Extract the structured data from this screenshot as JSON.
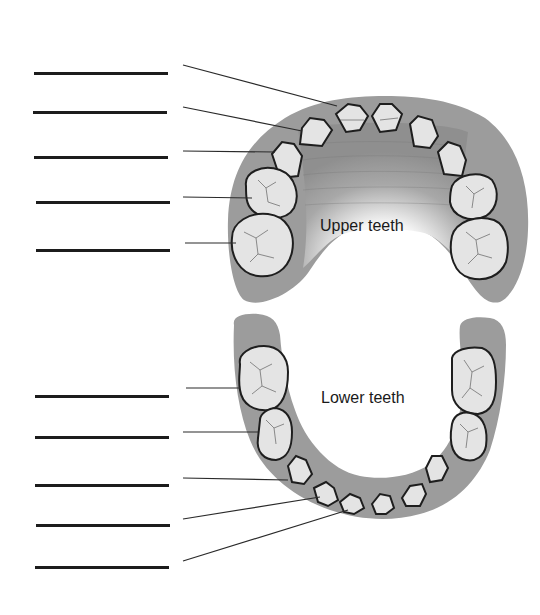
{
  "diagram": {
    "title": "",
    "upper_arch": {
      "label": "Upper teeth",
      "answer_blanks": 5
    },
    "lower_arch": {
      "label": "Lower teeth",
      "answer_blanks": 5
    },
    "blanks": [
      {
        "id": 1,
        "arch": "upper",
        "value": ""
      },
      {
        "id": 2,
        "arch": "upper",
        "value": ""
      },
      {
        "id": 3,
        "arch": "upper",
        "value": ""
      },
      {
        "id": 4,
        "arch": "upper",
        "value": ""
      },
      {
        "id": 5,
        "arch": "upper",
        "value": ""
      },
      {
        "id": 6,
        "arch": "lower",
        "value": ""
      },
      {
        "id": 7,
        "arch": "lower",
        "value": ""
      },
      {
        "id": 8,
        "arch": "lower",
        "value": ""
      },
      {
        "id": 9,
        "arch": "lower",
        "value": ""
      },
      {
        "id": 10,
        "arch": "lower",
        "value": ""
      }
    ],
    "colors": {
      "gum": "#9c9c9c",
      "gum_dark": "#8a8a8a",
      "tooth": "#e4e4e4",
      "tooth_outline": "#1e1e1e",
      "leader_line": "#2a2a2a",
      "blank_line": "#1c1c1c"
    }
  }
}
